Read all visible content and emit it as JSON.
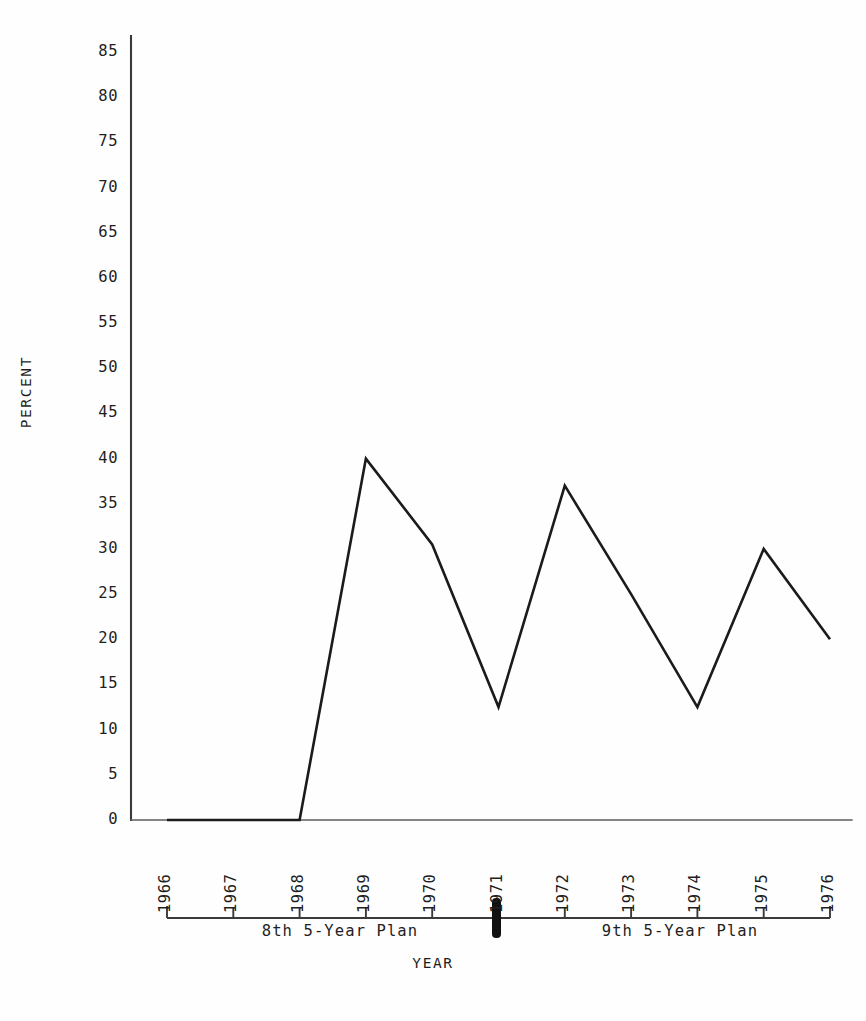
{
  "chart_data": {
    "type": "line",
    "title": "",
    "subtitle": "",
    "xlabel": "YEAR",
    "ylabel": "PERCENT",
    "x": [
      1966,
      1967,
      1968,
      1969,
      1970,
      1971,
      1972,
      1973,
      1974,
      1975,
      1976
    ],
    "categories": [
      "1966",
      "1967",
      "1968",
      "1969",
      "1970",
      "1971",
      "1972",
      "1973",
      "1974",
      "1975",
      "1976"
    ],
    "values": [
      0,
      0,
      0,
      40,
      30.5,
      12.5,
      37,
      25,
      12.5,
      30,
      20
    ],
    "series": [
      {
        "name": "percent",
        "values": [
          0,
          0,
          0,
          40,
          30.5,
          12.5,
          37,
          25,
          12.5,
          30,
          20
        ]
      }
    ],
    "xlim": [
      1966,
      1976
    ],
    "ylim": [
      0,
      85
    ],
    "ytick_values": [
      0,
      5,
      10,
      15,
      20,
      25,
      30,
      35,
      40,
      45,
      50,
      55,
      60,
      65,
      70,
      75,
      80,
      85
    ],
    "ytick_labels": [
      "0",
      "5",
      "10",
      "15",
      "20",
      "25",
      "30",
      "35",
      "40",
      "45",
      "50",
      "55",
      "60",
      "65",
      "70",
      "75",
      "80",
      "85"
    ],
    "xtick_labels": [
      "1966",
      "1967",
      "1968",
      "1969",
      "1970",
      "1971",
      "1972",
      "1973",
      "1974",
      "1975",
      "1976"
    ],
    "grid": false,
    "legend": null,
    "line_color": "#1b1b1b",
    "annotations": [
      {
        "text": "8th 5-Year Plan",
        "at_year_range": [
          1966,
          1971
        ]
      },
      {
        "text": "9th 5-Year Plan",
        "at_year_range": [
          1971,
          1976
        ]
      },
      {
        "text": "",
        "marker": "thick-divider-at-1971"
      }
    ]
  },
  "axes": {
    "y_axis_label": "PERCENT",
    "x_axis_label": "YEAR"
  },
  "timeline": {
    "divider_year": "1971",
    "periods": [
      {
        "label": "8th 5-Year Plan"
      },
      {
        "label": "9th 5-Year Plan"
      }
    ]
  },
  "colors": {
    "line": "#1b1b1b",
    "axis": "#3a3a3a",
    "text": "#1f1f1f",
    "background": "#fefefe"
  }
}
